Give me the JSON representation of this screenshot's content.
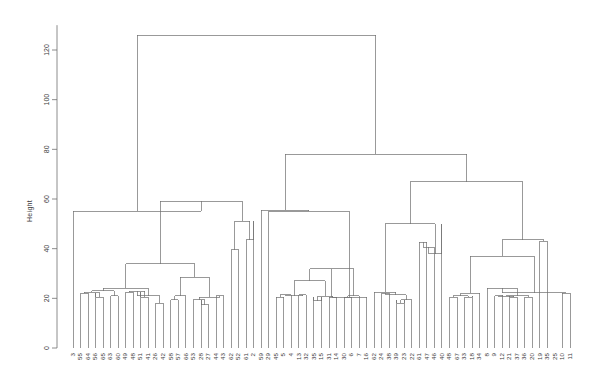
{
  "figure": {
    "type": "dendrogram",
    "ylabel": "Height",
    "background": "#ffffff",
    "line_color": "#6e6e6e"
  },
  "axis": {
    "y_ticks": [
      0,
      20,
      40,
      60,
      80,
      100,
      120
    ],
    "y_tick_labels": [
      "0",
      "20",
      "40",
      "60",
      "80",
      "100",
      "120"
    ],
    "ylim": [
      0,
      130
    ],
    "y_label": "Height"
  },
  "chart_data": {
    "type": "line",
    "title": "",
    "xlabel": "",
    "ylabel": "Height",
    "ylim": [
      0,
      130
    ],
    "grid": false,
    "legend": "none",
    "plot_kind": "dendrogram",
    "leaf_count": 67,
    "categories": [
      "3",
      "55",
      "64",
      "56",
      "65",
      "63",
      "60",
      "49",
      "48",
      "51",
      "41",
      "26",
      "42",
      "58",
      "57",
      "66",
      "53",
      "28",
      "27",
      "44",
      "43",
      "62",
      "52",
      "61",
      "2",
      "59",
      "29",
      "45",
      "5",
      "4",
      "13",
      "32",
      "35",
      "15",
      "31",
      "14",
      "30",
      "6",
      "7",
      "16",
      "62",
      "24",
      "38",
      "39",
      "23",
      "22",
      "61",
      "47",
      "46",
      "40",
      "48",
      "67",
      "33",
      "18",
      "34",
      "8",
      "9",
      "12",
      "21",
      "37",
      "36",
      "20",
      "19",
      "35",
      "25",
      "10",
      "11"
    ],
    "leaf_labels": [
      "3",
      "55",
      "64",
      "56",
      "65",
      "63",
      "60",
      "49",
      "48",
      "51",
      "41",
      "26",
      "42",
      "58",
      "57",
      "66",
      "53",
      "28",
      "27",
      "44",
      "43",
      "62",
      "52",
      "61",
      "2",
      "59",
      "29",
      "45",
      "5",
      "4",
      "13",
      "32",
      "35",
      "15",
      "31",
      "14",
      "30",
      "6",
      "7",
      "16",
      "62",
      "24",
      "38",
      "39",
      "23",
      "22",
      "61",
      "47",
      "46",
      "40",
      "48",
      "67",
      "33",
      "18",
      "34",
      "8",
      "9",
      "12",
      "21",
      "37",
      "36",
      "20",
      "19",
      "35",
      "25",
      "10",
      "11"
    ],
    "values": [
      55,
      20.5,
      22,
      22,
      20.5,
      21,
      20,
      19.5,
      22.5,
      22.5,
      20.5,
      18,
      18,
      19.5,
      19.5,
      20.5,
      19,
      19.5,
      17,
      21,
      20,
      20,
      39.5,
      43.5,
      51,
      55.5,
      20.5,
      20.5,
      20.5,
      21.5,
      21.5,
      19,
      20.5,
      20.5,
      20.5,
      20.5,
      20.5,
      20.5,
      20.5,
      20.5,
      22,
      21,
      18,
      19.5,
      19.5,
      19.5,
      42.5,
      40.5,
      38,
      50,
      20.5,
      20.5,
      20.5,
      21,
      21,
      22,
      20,
      21.5,
      21,
      20.5,
      20.5,
      20.5,
      20.5,
      20.5,
      22,
      22,
      22
    ],
    "merge_heights": [
      126,
      59,
      55,
      51,
      50,
      43.5,
      39.5,
      37,
      34,
      32,
      28.5,
      27,
      24,
      22,
      21.5,
      20.5,
      19.5,
      18,
      17
    ],
    "root_height": 126
  }
}
